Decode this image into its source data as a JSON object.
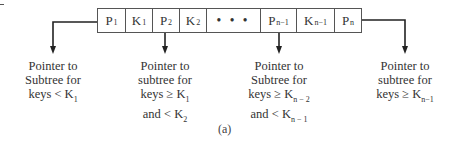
{
  "node": {
    "cells": [
      {
        "base": "P",
        "sub": "1",
        "width": 28
      },
      {
        "base": "K",
        "sub": "1",
        "width": 27
      },
      {
        "base": "P",
        "sub": "2",
        "width": 27
      },
      {
        "base": "K",
        "sub": "2",
        "width": 27
      },
      {
        "base": "• • •",
        "sub": "",
        "width": 54
      },
      {
        "base": "P",
        "sub": "n−1",
        "width": 36
      },
      {
        "base": "K",
        "sub": "n−1",
        "width": 38
      },
      {
        "base": "P",
        "sub": "n",
        "width": 26
      }
    ]
  },
  "labels": [
    {
      "lines": [
        {
          "text": "Pointer to",
          "sub": ""
        },
        {
          "text": "Subtree for",
          "sub": ""
        },
        {
          "text": "keys < K",
          "sub": "1"
        }
      ]
    },
    {
      "lines": [
        {
          "text": "Pointer to",
          "sub": ""
        },
        {
          "text": "subtree for",
          "sub": ""
        },
        {
          "text": "keys ≥ K",
          "sub": "1"
        },
        {
          "text": "and < K",
          "sub": "2"
        }
      ]
    },
    {
      "lines": [
        {
          "text": "Pointer to",
          "sub": ""
        },
        {
          "text": "Subtree for",
          "sub": ""
        },
        {
          "text": "keys ≥ K",
          "sub": "n − 2"
        },
        {
          "text": "and < K",
          "sub": "n − 1"
        }
      ]
    },
    {
      "lines": [
        {
          "text": "Pointer to",
          "sub": ""
        },
        {
          "text": "subtree for",
          "sub": ""
        },
        {
          "text": "keys ≥ K",
          "sub": "n−1"
        }
      ]
    }
  ],
  "caption": "(a)"
}
